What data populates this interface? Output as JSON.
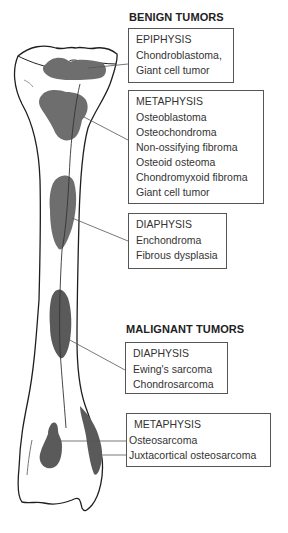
{
  "benign": {
    "heading": "BENIGN TUMORS",
    "epiphysis": {
      "title": "EPIPHYSIS",
      "items": [
        "Chondroblastoma,",
        "Giant cell tumor"
      ]
    },
    "metaphysis": {
      "title": "METAPHYSIS",
      "items": [
        "Osteoblastoma",
        "Osteochondroma",
        "Non-ossifying fibroma",
        "Osteoid osteoma",
        "Chondromyxoid fibroma",
        "Giant cell tumor"
      ]
    },
    "diaphysis": {
      "title": "DIAPHYSIS",
      "items": [
        "Enchondroma",
        "Fibrous dysplasia"
      ]
    }
  },
  "malignant": {
    "heading": "MALIGNANT TUMORS",
    "diaphysis": {
      "title": "DIAPHYSIS",
      "items": [
        "Ewing's sarcoma",
        "Chondrosarcoma"
      ]
    },
    "metaphysis": {
      "title": "METAPHYSIS",
      "items": [
        "Osteosarcoma",
        "Juxtacortical osteosarcoma"
      ]
    }
  },
  "colors": {
    "bone_outline": "#1e1e1e",
    "lesion_fill": "#6e6e6e",
    "leader_line": "#555555",
    "box_border": "#555555"
  }
}
